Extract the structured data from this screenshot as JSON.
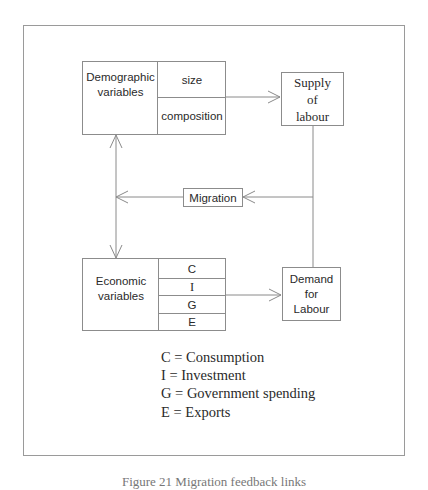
{
  "diagram": {
    "demographic": {
      "label_line1": "Demographic",
      "label_line2": "variables",
      "sub": [
        "size",
        "composition"
      ]
    },
    "supply": {
      "line1": "Supply",
      "line2": "of",
      "line3": "labour"
    },
    "migration": {
      "label": "Migration"
    },
    "economic": {
      "label_line1": "Economic",
      "label_line2": "variables",
      "sub": [
        "C",
        "I",
        "G",
        "E"
      ]
    },
    "demand": {
      "line1": "Demand",
      "line2": "for",
      "line3": "Labour"
    },
    "legend": [
      "C = Consumption",
      "I = Investment",
      "G = Government spending",
      "E = Exports"
    ],
    "caption": "Figure 21 Migration feedback links"
  }
}
